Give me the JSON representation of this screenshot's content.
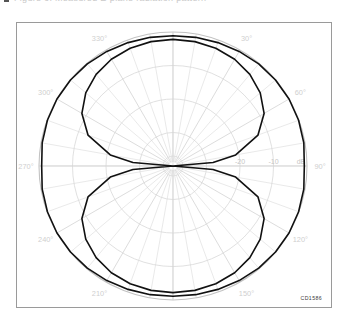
{
  "caption": {
    "text": "Figure 6. Measured E-plane radiation pattern",
    "bullet_icon": "square-bullet-icon"
  },
  "figure": {
    "plot_code": "CD1586"
  },
  "chart_data": {
    "type": "line",
    "subtype": "polar-radiation-pattern",
    "title": "",
    "xlabel": "",
    "ylabel": "dB",
    "grid": true,
    "legend": false,
    "angular_axis": {
      "unit": "degrees",
      "direction": "clockwise",
      "zero_at": "top",
      "major_tick_step": 30,
      "minor_tick_step": 10,
      "labels": [
        "0°",
        "30°",
        "60°",
        "90°",
        "120°",
        "150°",
        "180°",
        "210°",
        "240°",
        "270°",
        "300°",
        "330°"
      ],
      "label_values": [
        0,
        30,
        60,
        90,
        120,
        150,
        180,
        210,
        240,
        270,
        300,
        330
      ]
    },
    "radial_axis": {
      "unit": "dB",
      "label": "dB",
      "outer_value": 0,
      "center_value": -40,
      "ring_step": 10,
      "ring_values": [
        0,
        -10,
        -20,
        -30,
        -40
      ],
      "visible_tick_labels": [
        "-20",
        "-10",
        "dB"
      ],
      "tick_label_values": [
        -20,
        -10,
        0
      ]
    },
    "series": [
      {
        "name": "outer-pattern",
        "style": "solid",
        "color": "#111111",
        "angles": [
          0,
          10,
          20,
          30,
          40,
          50,
          60,
          70,
          80,
          90,
          100,
          110,
          120,
          130,
          140,
          150,
          160,
          170,
          180,
          190,
          200,
          210,
          220,
          230,
          240,
          250,
          260,
          270,
          280,
          290,
          300,
          310,
          320,
          330,
          340,
          350
        ],
        "values_db": [
          -1.1,
          -1.0,
          -0.8,
          -0.5,
          -0.2,
          -0.05,
          0.0,
          -0.1,
          -0.35,
          -0.8,
          -0.35,
          -0.1,
          0.0,
          -0.05,
          -0.2,
          -0.5,
          -0.8,
          -1.0,
          -1.1,
          -1.0,
          -0.8,
          -0.5,
          -0.2,
          -0.05,
          0.0,
          -0.1,
          -0.35,
          -0.8,
          -0.35,
          -0.1,
          0.0,
          -0.05,
          -0.2,
          -0.5,
          -0.8,
          -1.0
        ]
      },
      {
        "name": "inner-pattern",
        "style": "solid",
        "color": "#111111",
        "angles": [
          0,
          10,
          20,
          30,
          40,
          50,
          60,
          70,
          80,
          85,
          90,
          95,
          100,
          110,
          120,
          130,
          140,
          150,
          160,
          170,
          180,
          190,
          200,
          210,
          220,
          230,
          240,
          250,
          260,
          265,
          270,
          275,
          280,
          290,
          300,
          310,
          320,
          330,
          340,
          350
        ],
        "values_db": [
          -2.2,
          -2.3,
          -2.6,
          -3.2,
          -4.3,
          -6.0,
          -8.6,
          -13.0,
          -21.0,
          -28.0,
          -40.0,
          -28.0,
          -21.0,
          -13.0,
          -8.6,
          -6.0,
          -4.3,
          -3.2,
          -2.6,
          -2.3,
          -2.2,
          -2.3,
          -2.6,
          -3.2,
          -4.3,
          -6.0,
          -8.6,
          -13.0,
          -21.0,
          -28.0,
          -40.0,
          -28.0,
          -21.0,
          -13.0,
          -8.6,
          -6.0,
          -4.3,
          -3.2,
          -2.6,
          -2.3
        ]
      }
    ]
  }
}
